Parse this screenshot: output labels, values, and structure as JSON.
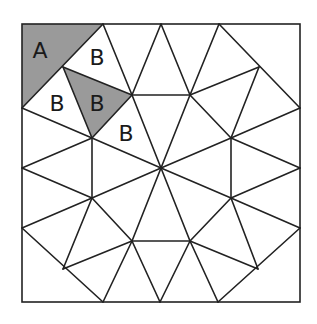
{
  "diagram": {
    "type": "square tiling with triangles",
    "square": {
      "x": 22,
      "y": 24,
      "width": 278,
      "height": 278
    },
    "colors": {
      "stroke": "#222222",
      "shaded_fill": "#9a9a9a",
      "background": "#ffffff"
    },
    "shaded_regions": [
      {
        "name": "region-A",
        "points": "22,24 103,24 22,108"
      },
      {
        "name": "region-B-shaded",
        "points": "63,67 132,95 92,138"
      }
    ],
    "edges": [
      [
        103,
        24,
        22,
        108
      ],
      [
        103,
        24,
        132,
        95
      ],
      [
        161,
        24,
        132,
        95
      ],
      [
        161,
        24,
        190,
        95
      ],
      [
        219,
        24,
        190,
        95
      ],
      [
        219,
        24,
        300,
        108
      ],
      [
        63,
        67,
        132,
        95
      ],
      [
        63,
        67,
        92,
        138
      ],
      [
        190,
        95,
        259,
        67
      ],
      [
        259,
        67,
        231,
        138
      ],
      [
        132,
        95,
        190,
        95
      ],
      [
        190,
        95,
        231,
        138
      ],
      [
        231,
        138,
        231,
        198
      ],
      [
        231,
        198,
        190,
        241
      ],
      [
        190,
        241,
        132,
        241
      ],
      [
        132,
        241,
        92,
        198
      ],
      [
        92,
        198,
        92,
        138
      ],
      [
        92,
        138,
        132,
        95
      ],
      [
        161,
        168,
        132,
        95
      ],
      [
        161,
        168,
        190,
        95
      ],
      [
        161,
        168,
        231,
        138
      ],
      [
        161,
        168,
        231,
        198
      ],
      [
        161,
        168,
        190,
        241
      ],
      [
        161,
        168,
        132,
        241
      ],
      [
        161,
        168,
        92,
        198
      ],
      [
        161,
        168,
        92,
        138
      ],
      [
        92,
        138,
        22,
        108
      ],
      [
        92,
        138,
        22,
        168
      ],
      [
        92,
        198,
        22,
        168
      ],
      [
        92,
        198,
        22,
        228
      ],
      [
        92,
        198,
        63,
        269
      ],
      [
        22,
        228,
        103,
        302
      ],
      [
        63,
        269,
        132,
        241
      ],
      [
        132,
        241,
        103,
        302
      ],
      [
        132,
        241,
        160,
        302
      ],
      [
        190,
        241,
        160,
        302
      ],
      [
        190,
        241,
        218,
        302
      ],
      [
        190,
        241,
        258,
        269
      ],
      [
        300,
        228,
        218,
        302
      ],
      [
        258,
        269,
        231,
        198
      ],
      [
        231,
        198,
        300,
        228
      ],
      [
        231,
        198,
        300,
        168
      ],
      [
        231,
        138,
        300,
        168
      ],
      [
        231,
        138,
        300,
        108
      ]
    ],
    "labels": [
      {
        "text": "A",
        "x": 40,
        "y": 50
      },
      {
        "text": "B",
        "x": 97,
        "y": 57
      },
      {
        "text": "B",
        "x": 57,
        "y": 103
      },
      {
        "text": "B",
        "x": 97,
        "y": 103
      },
      {
        "text": "B",
        "x": 126,
        "y": 133
      }
    ]
  }
}
